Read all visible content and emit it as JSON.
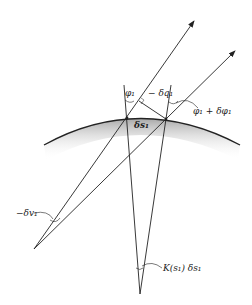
{
  "diagram": {
    "type": "geometric ray diagram",
    "labels": {
      "phi1": "φ₁",
      "neg_delta_q1": "− δq₁",
      "phi1_plus_delta_phi1": "φ₁ + δφ₁",
      "delta_s1": "δs₁",
      "neg_delta_v1": "−δv₁",
      "curvature_term": "K(s₁) δs₁"
    },
    "colors": {
      "line": "#222222",
      "surface_shade": "#b8b8b8"
    }
  }
}
